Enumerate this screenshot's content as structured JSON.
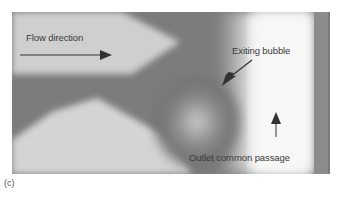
{
  "figure": {
    "panel_label": "(c)",
    "annotations": {
      "flow_direction": "Flow direction",
      "exiting_bubble": "Exiting bubble",
      "outlet_passage": "Outlet common passage"
    }
  }
}
